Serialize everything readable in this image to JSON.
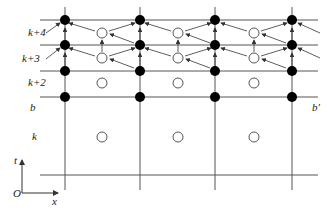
{
  "diagram": {
    "row_labels": {
      "k4": "k+4",
      "k3": "k+3",
      "k2": "k+2",
      "b": "b",
      "k": "k"
    },
    "right_label": "b′",
    "axes": {
      "origin": "O",
      "x": "x",
      "t": "t"
    },
    "colors": {
      "line": "#555555",
      "filled_node": "#000000",
      "open_node": "#ffffff",
      "arrow": "#333333"
    },
    "node_types": [
      "filled-node",
      "open-node"
    ]
  }
}
